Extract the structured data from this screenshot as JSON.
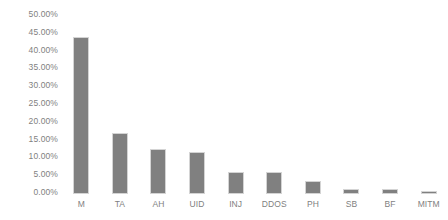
{
  "chart_data": {
    "type": "bar",
    "title": "",
    "subtitle": "",
    "xlabel": "",
    "ylabel": "",
    "categories": [
      "M",
      "TA",
      "AH",
      "UID",
      "INJ",
      "DDOS",
      "PH",
      "SB",
      "BF",
      "MITM"
    ],
    "values": [
      43.4,
      16.6,
      12.1,
      11.2,
      5.6,
      5.6,
      3.1,
      0.9,
      0.9,
      0.2
    ],
    "value_labels": [
      "43.40%",
      "16.60%",
      "12.10%",
      "11.20%",
      "5.60%",
      "5.60%",
      "3.10%",
      "0.90%",
      "0.90%",
      "0.20%"
    ],
    "ylim": [
      0,
      50
    ],
    "y_ticks": [
      0,
      5,
      10,
      15,
      20,
      25,
      30,
      35,
      40,
      45,
      50
    ],
    "y_tick_labels": [
      "0.00%",
      "5.00%",
      "10.00%",
      "15.00%",
      "20.00%",
      "25.00%",
      "30.00%",
      "35.00%",
      "40.00%",
      "45.00%",
      "50.00%"
    ],
    "grid": false,
    "axis_line": false,
    "legend": false,
    "legend_position": "none",
    "series": [
      {
        "name": "",
        "values": [
          43.4,
          16.6,
          12.1,
          11.2,
          5.6,
          5.6,
          3.1,
          0.9,
          0.9,
          0.2
        ]
      }
    ],
    "colors": {
      "bar_fill": "#808080",
      "bar_edge": "#d4d4d4",
      "tick_label": "#7f7f7f",
      "background": "#ffffff"
    }
  }
}
